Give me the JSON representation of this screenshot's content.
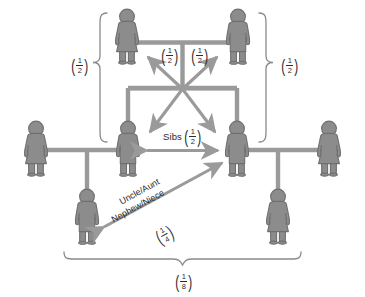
{
  "diagram": {
    "type": "pedigree",
    "background_color": "#ffffff",
    "figure_fill": "#8c8c8c",
    "figure_stroke": "#6b6b6b",
    "line_color": "#9a9a9a",
    "arrow_color": "#9a9a9a",
    "brace_color": "#8a8a8a",
    "text_color": "#2b2b2b"
  },
  "labels": {
    "parent_left_half": {
      "numerator": "1",
      "denominator": "2"
    },
    "parent_right_half": {
      "numerator": "1",
      "denominator": "2"
    },
    "brace_left": {
      "numerator": "1",
      "denominator": "2"
    },
    "brace_right": {
      "numerator": "1",
      "denominator": "2"
    },
    "sibs_word": "Sibs",
    "sibs_value": {
      "numerator": "1",
      "denominator": "2"
    },
    "uncle_aunt": "Uncle/Aunt",
    "nephew_niece": "Nephew/Niece",
    "uncle_value": {
      "numerator": "1",
      "denominator": "4"
    },
    "brace_bottom": {
      "numerator": "1",
      "denominator": "8"
    }
  },
  "people": [
    {
      "id": "mother-top",
      "sex": "female",
      "role": "grandmother",
      "row": "top"
    },
    {
      "id": "father-top",
      "sex": "male",
      "role": "grandfather",
      "row": "top"
    },
    {
      "id": "son-left",
      "sex": "male",
      "role": "sibling-left",
      "row": "middle"
    },
    {
      "id": "son-right",
      "sex": "male",
      "role": "sibling-right",
      "row": "middle"
    },
    {
      "id": "spouse-far-left",
      "sex": "female",
      "role": "spouse-of-left",
      "row": "middle"
    },
    {
      "id": "spouse-far-right",
      "sex": "female",
      "role": "spouse-of-right",
      "row": "middle"
    },
    {
      "id": "child-left",
      "sex": "male",
      "role": "nephew",
      "row": "bottom"
    },
    {
      "id": "child-right",
      "sex": "female",
      "role": "niece",
      "row": "bottom"
    }
  ],
  "relationships": [
    {
      "from": "mother-top",
      "to": "son-left",
      "kinship": "1/2",
      "kind": "parent-offspring"
    },
    {
      "from": "father-top",
      "to": "son-right",
      "kinship": "1/2",
      "kind": "parent-offspring"
    },
    {
      "from": "son-left",
      "to": "son-right",
      "kinship": "1/2",
      "kind": "siblings"
    },
    {
      "from": "son-left",
      "to": "child-right",
      "kinship": "1/4",
      "kind": "uncle-niece"
    },
    {
      "from": "child-left",
      "to": "child-right",
      "kinship": "1/8",
      "kind": "first-cousins"
    }
  ]
}
